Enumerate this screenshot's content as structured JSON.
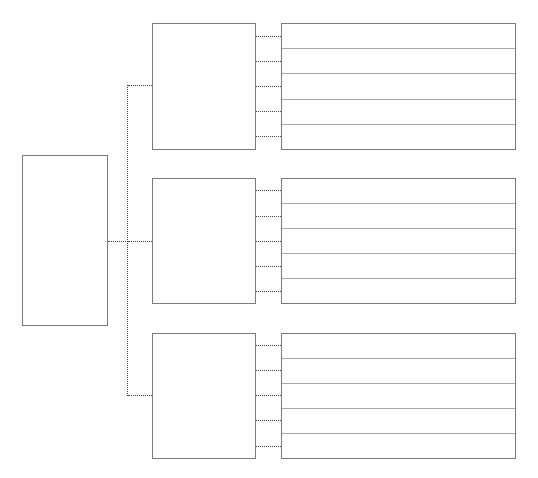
{
  "diagram": {
    "type": "tree",
    "title_clipped": "",
    "colors": {
      "box_border": "#7a7a7a",
      "row_divider": "#a9a9a9",
      "connector": "#444444",
      "background": "#ffffff"
    },
    "root": {
      "label": ""
    },
    "branches": [
      {
        "label": "",
        "rows": [
          "",
          "",
          "",
          "",
          ""
        ]
      },
      {
        "label": "",
        "rows": [
          "",
          "",
          "",
          "",
          ""
        ]
      },
      {
        "label": "",
        "rows": [
          "",
          "",
          "",
          "",
          ""
        ]
      }
    ]
  }
}
